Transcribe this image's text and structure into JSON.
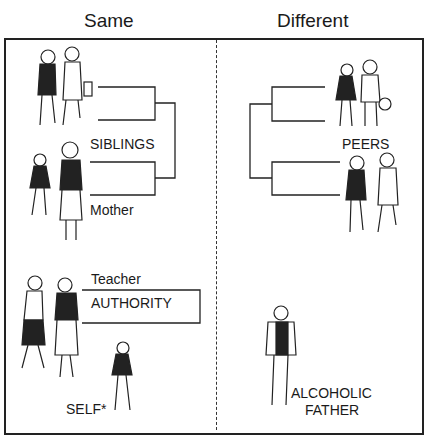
{
  "columns": [
    {
      "heading": "Same"
    },
    {
      "heading": "Different"
    }
  ],
  "same": {
    "siblings_label": "SIBLINGS",
    "mother_label": "Mother",
    "teacher_label": "Teacher",
    "authority_label": "AUTHORITY",
    "self_label": "SELF*"
  },
  "different": {
    "peers_label": "PEERS",
    "father_label_line1": "ALCOHOLIC",
    "father_label_line2": "FATHER"
  },
  "illustrations": [
    "sibling-pair-girl-boy",
    "girl-and-mother",
    "two-teachers",
    "self-child-girl",
    "peer-pair-girl-boy",
    "peer-pair-girl-boy-2",
    "alcoholic-father-man"
  ],
  "colors": {
    "ink": "#1a1a1a",
    "background": "#ffffff"
  }
}
